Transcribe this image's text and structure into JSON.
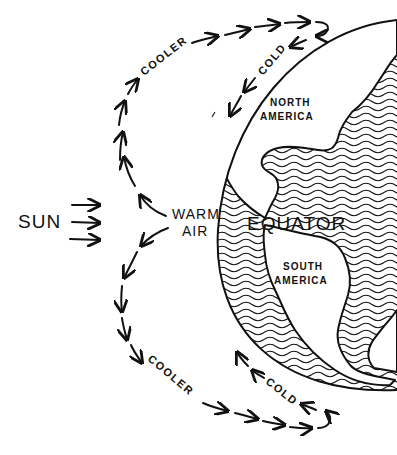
{
  "diagram": {
    "labels": {
      "sun": "SUN",
      "warm_air_line1": "WARM",
      "warm_air_line2": "AIR",
      "equator": "EQUATOR",
      "north_america_line1": "NORTH",
      "north_america_line2": "AMERICA",
      "south_america_line1": "SOUTH",
      "south_america_line2": "AMERICA",
      "cooler_top": "COOLER",
      "cold_top": "COLD",
      "cooler_bottom": "COOLER",
      "cold_bottom": "COLD"
    },
    "elements": {
      "sun_arrows": 3,
      "earth": "hemisphere outline with hatched ocean",
      "upper_loop": "arrows rising from warm air, cooling, returning cold toward North America",
      "lower_loop": "arrows descending from warm air, cooling, returning cold toward South America"
    },
    "colors": {
      "ink": "#111111",
      "paper": "#ffffff"
    }
  }
}
